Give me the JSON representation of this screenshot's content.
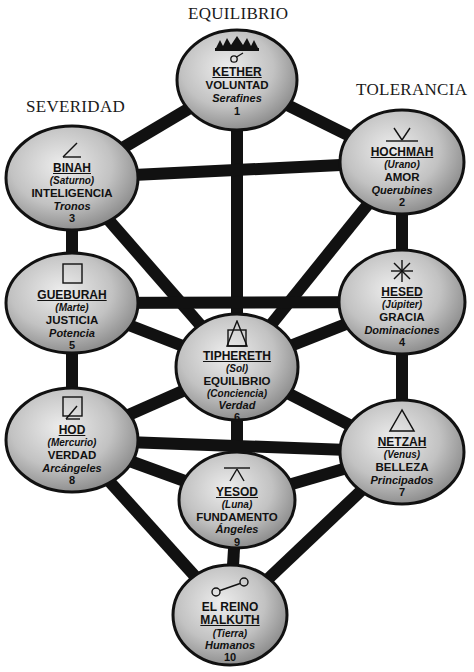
{
  "pillars": {
    "center": "EQUILIBRIO",
    "right": "TOLERANCIA",
    "left": "SEVERIDAD"
  },
  "colors": {
    "path": "#111111",
    "node_fill_light": "#e6e6e6",
    "node_fill_dark": "#8a8a8a",
    "node_stroke": "#111111",
    "background": "#ffffff"
  },
  "sephiroth": [
    {
      "id": 1,
      "name": "KETHER",
      "planet": "",
      "quality": "VOLUNTAD",
      "conscience": "",
      "choir": "Serafines",
      "number": "1",
      "symbol": "crown-icon",
      "cx": 237,
      "cy": 80,
      "rx": 60,
      "ry": 50
    },
    {
      "id": 2,
      "name": "HOCHMAH",
      "planet": "(Urano)",
      "quality": "AMOR",
      "conscience": "",
      "choir": "Querubines",
      "number": "2",
      "symbol": "uranus-icon",
      "cx": 402,
      "cy": 162,
      "rx": 62,
      "ry": 52
    },
    {
      "id": 3,
      "name": "BINAH",
      "planet": "(Saturno)",
      "quality": "INTELIGENCIA",
      "conscience": "",
      "choir": "Tronos",
      "number": "3",
      "symbol": "saturn-angle-icon",
      "cx": 72,
      "cy": 178,
      "rx": 66,
      "ry": 52
    },
    {
      "id": 4,
      "name": "HESED",
      "planet": "(Júpiter)",
      "quality": "GRACIA",
      "conscience": "",
      "choir": "Dominaciones",
      "number": "4",
      "symbol": "jupiter-star-icon",
      "cx": 402,
      "cy": 302,
      "rx": 63,
      "ry": 52
    },
    {
      "id": 5,
      "name": "GUEBURAH",
      "planet": "(Marte)",
      "quality": "JUSTICIA",
      "conscience": "",
      "choir": "Potencia",
      "number": "5",
      "symbol": "mars-square-icon",
      "cx": 72,
      "cy": 303,
      "rx": 66,
      "ry": 50
    },
    {
      "id": 6,
      "name": "TIPHERETH",
      "planet": "(Sol)",
      "quality": "EQUILIBRIO",
      "conscience": "(Conciencia)",
      "choir": "Verdad",
      "number": "6",
      "symbol": "sun-triangle-square-icon",
      "cx": 237,
      "cy": 367,
      "rx": 61,
      "ry": 53
    },
    {
      "id": 7,
      "name": "NETZAH",
      "planet": "(Venus)",
      "quality": "BELLEZA",
      "conscience": "",
      "choir": "Principados",
      "number": "7",
      "symbol": "venus-triangle-icon",
      "cx": 402,
      "cy": 452,
      "rx": 62,
      "ry": 52
    },
    {
      "id": 8,
      "name": "HOD",
      "planet": "(Mercurio)",
      "quality": "VERDAD",
      "conscience": "",
      "choir": "Arcángeles",
      "number": "8",
      "symbol": "mercury-square-angle-icon",
      "cx": 72,
      "cy": 440,
      "rx": 66,
      "ry": 52
    },
    {
      "id": 9,
      "name": "YESOD",
      "planet": "(Luna)",
      "quality": "FUNDAMENTO",
      "conscience": "",
      "choir": "Ángeles",
      "number": "9",
      "symbol": "moon-caret-icon",
      "cx": 237,
      "cy": 500,
      "rx": 58,
      "ry": 48
    },
    {
      "id": 10,
      "name": "EL REINO",
      "name2": "MALKUTH",
      "planet": "(Tierra)",
      "quality": "",
      "conscience": "",
      "choir": "Humanos",
      "number": "10",
      "symbol": "earth-dumbbell-icon",
      "cx": 230,
      "cy": 615,
      "rx": 57,
      "ry": 50
    }
  ],
  "paths": [
    [
      1,
      2
    ],
    [
      1,
      3
    ],
    [
      1,
      6
    ],
    [
      2,
      3
    ],
    [
      2,
      4
    ],
    [
      2,
      6
    ],
    [
      3,
      5
    ],
    [
      3,
      6
    ],
    [
      4,
      5
    ],
    [
      4,
      6
    ],
    [
      4,
      7
    ],
    [
      5,
      6
    ],
    [
      5,
      8
    ],
    [
      6,
      7
    ],
    [
      6,
      8
    ],
    [
      6,
      9
    ],
    [
      7,
      8
    ],
    [
      7,
      9
    ],
    [
      7,
      10
    ],
    [
      8,
      9
    ],
    [
      8,
      10
    ],
    [
      9,
      10
    ]
  ]
}
